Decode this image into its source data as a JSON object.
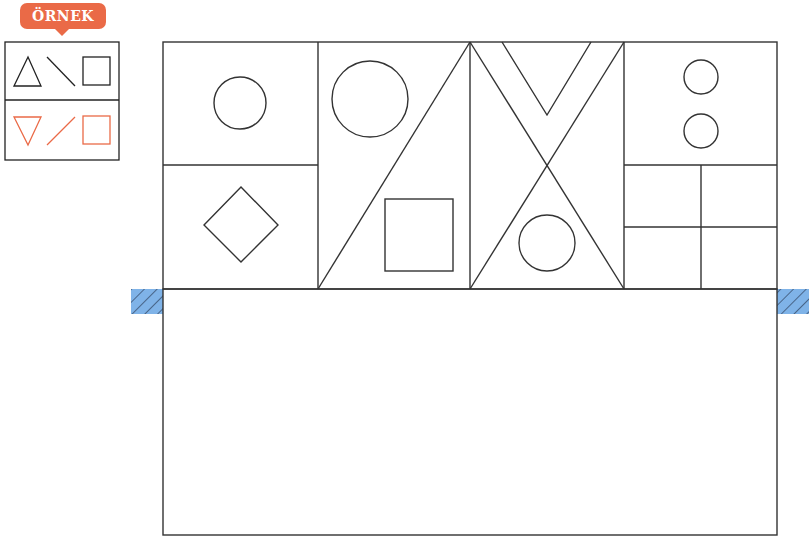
{
  "example": {
    "badge_label": "ÖRNEK",
    "badge_color": "#ea6a47",
    "row_original": [
      "triangle",
      "backslash-line",
      "square"
    ],
    "row_reflected": [
      "inverted-triangle",
      "slash-line",
      "square"
    ],
    "original_color": "#222222",
    "reflected_color": "#ea6a47"
  },
  "grid": {
    "line_color": "#333333",
    "columns": [
      {
        "id": 1,
        "shapes": [
          "circle",
          "diamond"
        ]
      },
      {
        "id": 2,
        "shapes": [
          "diagonal-line",
          "circle",
          "square"
        ]
      },
      {
        "id": 3,
        "shapes": [
          "x-lines",
          "v-shape",
          "circle"
        ]
      },
      {
        "id": 4,
        "shapes": [
          "circle",
          "circle",
          "four-squares"
        ]
      }
    ],
    "mirror_marker_color": "#7fb3e8",
    "answer_area": "empty"
  }
}
